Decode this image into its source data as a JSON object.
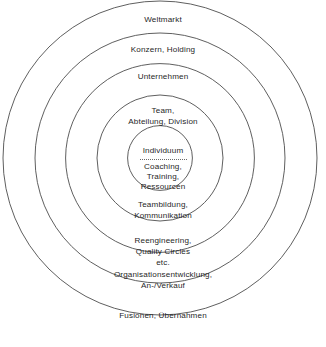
{
  "diagram": {
    "type": "concentric-circles",
    "title": "",
    "geometry": {
      "center_x": 160,
      "center_y": 158,
      "radii": [
        157,
        125,
        94.4,
        63,
        32.4
      ]
    },
    "stroke_color": "#4d4d4d",
    "text_color": "#1f1f1f",
    "background_color": "#ffffff",
    "rings": [
      {
        "index": 1,
        "scope_label": "Weltmarkt",
        "intervention_label": "Fusionen, Übernahmen"
      },
      {
        "index": 2,
        "scope_label": "Konzern, Holding",
        "intervention_label": "Organisationsentwicklung,\nAn-/Verkauf"
      },
      {
        "index": 3,
        "scope_label": "Unternehmen",
        "intervention_label": "Reengineering,\nQuality Circles\netc."
      },
      {
        "index": 4,
        "scope_label": "Team,\nAbteilung, Division",
        "intervention_label": "Teambildung,\nKommunikation"
      },
      {
        "index": 5,
        "scope_label": "Individuum",
        "intervention_label": "Coaching,\nTraining,\nRessourcen"
      }
    ]
  }
}
